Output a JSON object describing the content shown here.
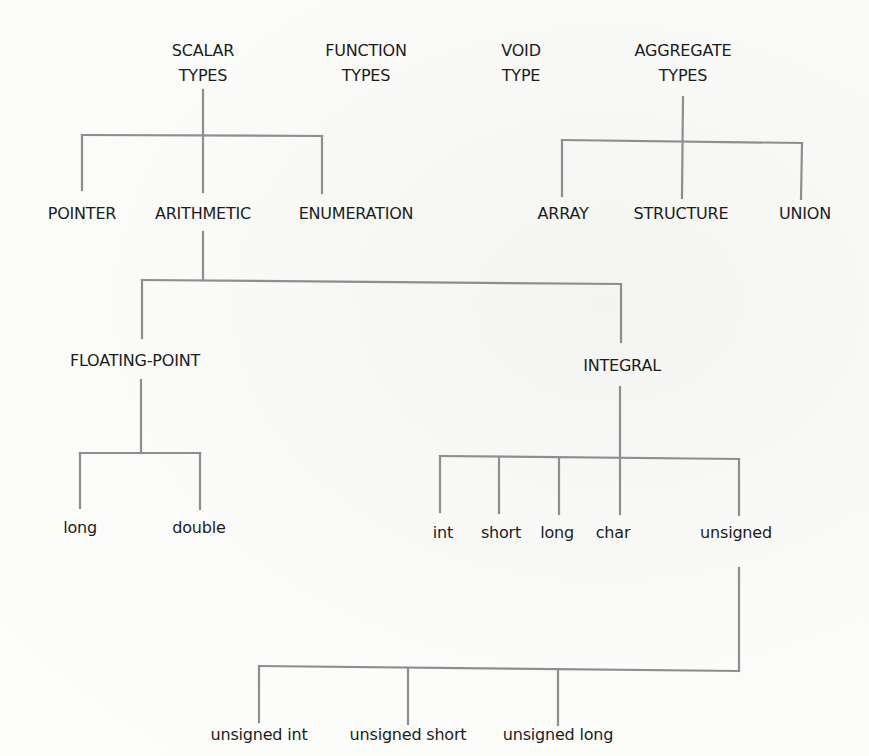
{
  "diagram": {
    "line_color": "#8e8e8e",
    "text_color": "#1c1c1c",
    "background": "#fbfbfa",
    "top_level": [
      {
        "id": "scalar",
        "line1": "SCALAR",
        "line2": "TYPES"
      },
      {
        "id": "function",
        "line1": "FUNCTION",
        "line2": "TYPES"
      },
      {
        "id": "void",
        "line1": "VOID",
        "line2": "TYPE"
      },
      {
        "id": "aggregate",
        "line1": "AGGREGATE",
        "line2": "TYPES"
      }
    ],
    "scalar_children": [
      "POINTER",
      "ARITHMETIC",
      "ENUMERATION"
    ],
    "aggregate_children": [
      "ARRAY",
      "STRUCTURE",
      "UNION"
    ],
    "arithmetic_children": [
      "FLOATING-POINT",
      "INTEGRAL"
    ],
    "floating_point_children": [
      "long",
      "double"
    ],
    "integral_children": [
      "int",
      "short",
      "long",
      "char",
      "unsigned"
    ],
    "unsigned_children": [
      "unsigned int",
      "unsigned short",
      "unsigned long"
    ]
  }
}
